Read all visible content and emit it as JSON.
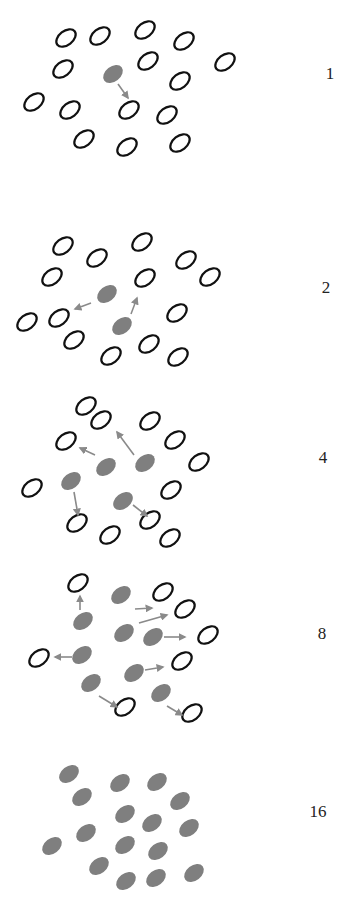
{
  "style": {
    "open_stroke": "#111111",
    "filled": "#7f7f7f",
    "arrow": "#8a8a8a",
    "rx": 11,
    "ry": 7,
    "angle": -38
  },
  "panels": [
    {
      "label": "1",
      "label_pos": [
        330,
        74
      ],
      "open": [
        [
          66,
          38
        ],
        [
          100,
          36
        ],
        [
          145,
          30
        ],
        [
          184,
          41
        ],
        [
          225,
          62
        ],
        [
          63,
          69
        ],
        [
          148,
          61
        ],
        [
          180,
          81
        ],
        [
          34,
          102
        ],
        [
          70,
          110
        ],
        [
          129,
          110
        ],
        [
          167,
          115
        ],
        [
          84,
          139
        ],
        [
          127,
          147
        ],
        [
          180,
          143
        ]
      ],
      "filled": [
        [
          113,
          74
        ]
      ],
      "arrows": [
        [
          [
            118,
            84
          ],
          [
            128,
            98
          ]
        ]
      ]
    },
    {
      "label": "2",
      "label_pos": [
        326,
        288
      ],
      "open": [
        [
          63,
          246
        ],
        [
          97,
          258
        ],
        [
          142,
          242
        ],
        [
          186,
          260
        ],
        [
          210,
          277
        ],
        [
          52,
          277
        ],
        [
          145,
          278
        ],
        [
          177,
          313
        ],
        [
          27,
          322
        ],
        [
          59,
          318
        ],
        [
          74,
          340
        ],
        [
          111,
          356
        ],
        [
          149,
          344
        ],
        [
          178,
          357
        ]
      ],
      "filled": [
        [
          107,
          294
        ],
        [
          122,
          326
        ]
      ],
      "arrows": [
        [
          [
            91,
            303
          ],
          [
            75,
            309
          ]
        ],
        [
          [
            131,
            314
          ],
          [
            137,
            298
          ]
        ]
      ]
    },
    {
      "label": "4",
      "label_pos": [
        323,
        458
      ],
      "open": [
        [
          86,
          406
        ],
        [
          101,
          420
        ],
        [
          150,
          421
        ],
        [
          175,
          440
        ],
        [
          199,
          462
        ],
        [
          66,
          441
        ],
        [
          32,
          488
        ],
        [
          171,
          490
        ],
        [
          77,
          523
        ],
        [
          110,
          535
        ],
        [
          150,
          520
        ],
        [
          170,
          538
        ]
      ],
      "filled": [
        [
          106,
          467
        ],
        [
          145,
          463
        ],
        [
          71,
          481
        ],
        [
          123,
          501
        ]
      ],
      "arrows": [
        [
          [
            95,
            455
          ],
          [
            80,
            448
          ]
        ],
        [
          [
            134,
            455
          ],
          [
            117,
            432
          ]
        ],
        [
          [
            74,
            492
          ],
          [
            78,
            515
          ]
        ],
        [
          [
            133,
            505
          ],
          [
            147,
            516
          ]
        ]
      ]
    },
    {
      "label": "8",
      "label_pos": [
        322,
        634
      ],
      "open": [
        [
          78,
          583
        ],
        [
          163,
          592
        ],
        [
          185,
          609
        ],
        [
          208,
          635
        ],
        [
          182,
          661
        ],
        [
          39,
          658
        ],
        [
          125,
          707
        ],
        [
          192,
          713
        ]
      ],
      "filled": [
        [
          121,
          595
        ],
        [
          83,
          621
        ],
        [
          124,
          633
        ],
        [
          153,
          637
        ],
        [
          82,
          655
        ],
        [
          134,
          673
        ],
        [
          91,
          683
        ],
        [
          161,
          693
        ]
      ],
      "arrows": [
        [
          [
            80,
            610
          ],
          [
            80,
            596
          ]
        ],
        [
          [
            135,
            609
          ],
          [
            152,
            608
          ]
        ],
        [
          [
            139,
            623
          ],
          [
            167,
            615
          ]
        ],
        [
          [
            164,
            637
          ],
          [
            185,
            637
          ]
        ],
        [
          [
            72,
            657
          ],
          [
            55,
            657
          ]
        ],
        [
          [
            145,
            670
          ],
          [
            163,
            667
          ]
        ],
        [
          [
            99,
            696
          ],
          [
            117,
            707
          ]
        ],
        [
          [
            167,
            706
          ],
          [
            182,
            715
          ]
        ]
      ]
    },
    {
      "label": "16",
      "label_pos": [
        318,
        812
      ],
      "open": [],
      "filled": [
        [
          69,
          774
        ],
        [
          82,
          797
        ],
        [
          120,
          783
        ],
        [
          157,
          782
        ],
        [
          180,
          801
        ],
        [
          125,
          814
        ],
        [
          152,
          823
        ],
        [
          189,
          828
        ],
        [
          52,
          846
        ],
        [
          86,
          833
        ],
        [
          125,
          845
        ],
        [
          158,
          851
        ],
        [
          99,
          866
        ],
        [
          126,
          881
        ],
        [
          156,
          878
        ],
        [
          194,
          873
        ]
      ],
      "arrows": []
    }
  ]
}
